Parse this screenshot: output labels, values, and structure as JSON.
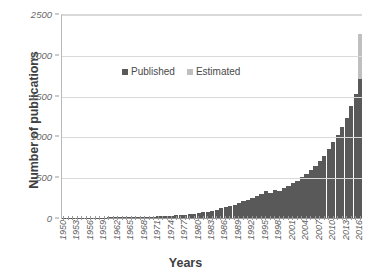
{
  "chart_data": {
    "type": "bar",
    "title": "",
    "xlabel": "Years",
    "ylabel": "Number of publications",
    "ylim": [
      0,
      2500
    ],
    "yticks": [
      0,
      500,
      1000,
      1500,
      2000,
      2500
    ],
    "ytick_labels": [
      "0",
      "500",
      "1000",
      "1500",
      "2000",
      "2500"
    ],
    "grid": true,
    "legend_position": "inside-upper-left",
    "stacked": true,
    "x_tick_step": 3,
    "categories": [
      "1950",
      "1951",
      "1952",
      "1953",
      "1954",
      "1955",
      "1956",
      "1957",
      "1958",
      "1959",
      "1960",
      "1961",
      "1962",
      "1963",
      "1964",
      "1965",
      "1966",
      "1967",
      "1968",
      "1969",
      "1970",
      "1971",
      "1972",
      "1973",
      "1974",
      "1975",
      "1976",
      "1977",
      "1978",
      "1979",
      "1980",
      "1981",
      "1982",
      "1983",
      "1984",
      "1985",
      "1986",
      "1987",
      "1988",
      "1989",
      "1990",
      "1991",
      "1992",
      "1993",
      "1994",
      "1995",
      "1996",
      "1997",
      "1998",
      "1999",
      "2000",
      "2001",
      "2002",
      "2003",
      "2004",
      "2005",
      "2006",
      "2007",
      "2008",
      "2009",
      "2010",
      "2011",
      "2012",
      "2013",
      "2014",
      "2015",
      "2016"
    ],
    "x_tick_labels": [
      "1950",
      "1953",
      "1956",
      "1959",
      "1962",
      "1965",
      "1968",
      "1971",
      "1974",
      "1977",
      "1980",
      "1983",
      "1986",
      "1989",
      "1992",
      "1995",
      "1998",
      "2001",
      "2004",
      "2007",
      "2010",
      "2013",
      "2016"
    ],
    "series": [
      {
        "name": "Published",
        "color": "#595959",
        "values": [
          2,
          2,
          3,
          3,
          4,
          4,
          5,
          5,
          6,
          6,
          7,
          8,
          8,
          9,
          10,
          11,
          12,
          13,
          14,
          16,
          18,
          20,
          22,
          25,
          28,
          32,
          36,
          40,
          45,
          52,
          60,
          68,
          78,
          90,
          104,
          118,
          132,
          148,
          165,
          185,
          205,
          225,
          250,
          270,
          300,
          335,
          310,
          345,
          335,
          370,
          395,
          430,
          455,
          500,
          545,
          590,
          640,
          700,
          760,
          840,
          930,
          1020,
          1120,
          1230,
          1370,
          1520,
          1700
        ]
      },
      {
        "name": "Estimated",
        "color": "#bfbfbf",
        "values": [
          0,
          0,
          0,
          0,
          0,
          0,
          0,
          0,
          0,
          0,
          0,
          0,
          0,
          0,
          0,
          0,
          0,
          0,
          0,
          0,
          0,
          0,
          0,
          0,
          0,
          0,
          0,
          0,
          0,
          0,
          0,
          0,
          0,
          0,
          0,
          0,
          0,
          0,
          0,
          0,
          0,
          0,
          0,
          0,
          0,
          0,
          0,
          0,
          0,
          0,
          0,
          0,
          0,
          0,
          0,
          0,
          0,
          0,
          0,
          0,
          0,
          0,
          0,
          0,
          0,
          0,
          550
        ]
      }
    ]
  }
}
